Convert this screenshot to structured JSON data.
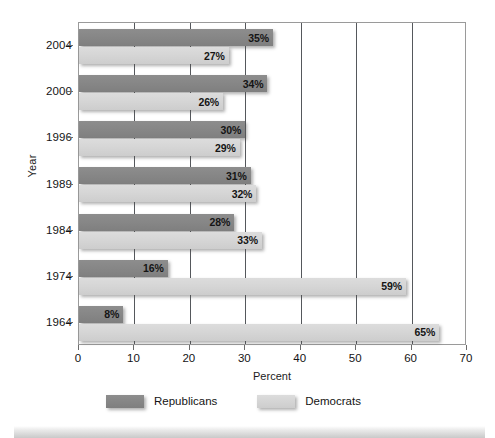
{
  "chart_data": {
    "type": "bar",
    "orientation": "horizontal",
    "title": "",
    "xlabel": "Percent",
    "ylabel": "Year",
    "categories": [
      "2004",
      "2000",
      "1996",
      "1989",
      "1984",
      "1974",
      "1964"
    ],
    "series": [
      {
        "name": "Republicans",
        "color": "#878787",
        "values": [
          35,
          34,
          30,
          31,
          28,
          16,
          8
        ],
        "labels": [
          "35%",
          "34%",
          "30%",
          "31%",
          "28%",
          "16%",
          "8%"
        ]
      },
      {
        "name": "Democrats",
        "color": "#d6d6d6",
        "values": [
          27,
          26,
          29,
          32,
          33,
          59,
          65
        ],
        "labels": [
          "27%",
          "26%",
          "29%",
          "32%",
          "33%",
          "59%",
          "65%"
        ]
      }
    ],
    "xlim": [
      0,
      70
    ],
    "x_ticks": [
      0,
      10,
      20,
      30,
      40,
      50,
      60,
      70
    ],
    "x_tick_labels": [
      "0",
      "10",
      "20",
      "30",
      "40",
      "50",
      "60",
      "70"
    ],
    "grid": true,
    "grid_axis": "x",
    "legend_position": "bottom",
    "legend_entries": [
      "Republicans",
      "Democrats"
    ]
  },
  "axes": {
    "y_title": "Year",
    "x_title": "Percent"
  },
  "legend": {
    "republicans_label": "Republicans",
    "democrats_label": "Democrats"
  }
}
